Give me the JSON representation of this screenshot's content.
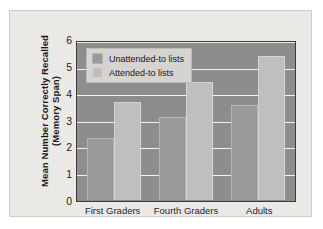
{
  "chart_data": {
    "type": "bar",
    "title": "",
    "xlabel": "",
    "ylabel": "Mean Number Correctly Recalled (Memory Span)",
    "ylabel_line1": "Mean Number Correctly Recalled",
    "ylabel_line2": "(Memory Span)",
    "categories": [
      "First Graders",
      "Fourth Graders",
      "Adults"
    ],
    "series": [
      {
        "name": "Unattended-to lists",
        "values": [
          2.35,
          3.15,
          3.6
        ],
        "color": "#9a9a9a"
      },
      {
        "name": "Attended-to lists",
        "values": [
          3.7,
          4.45,
          5.45
        ],
        "color": "#bfbfbf"
      }
    ],
    "ylim": [
      0,
      6
    ],
    "yticks": [
      0,
      1,
      2,
      3,
      4,
      5,
      6
    ],
    "ytick_labels": [
      "0",
      "1",
      "2",
      "3",
      "4",
      "5",
      "6"
    ],
    "grid": true,
    "grid_color": "#f2f2f2",
    "legend_position": "upper left inside plot",
    "plot_background": "#8d8d8d",
    "figure_background": "#ebe9e6"
  },
  "legend": {
    "entries": [
      {
        "label": "Unattended-to lists"
      },
      {
        "label": "Attended-to lists"
      }
    ]
  }
}
